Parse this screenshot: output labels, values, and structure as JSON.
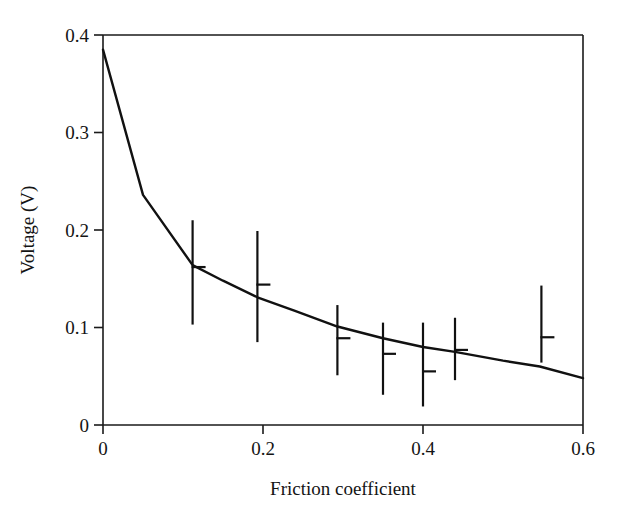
{
  "chart_data": {
    "type": "line",
    "title": "",
    "xlabel": "Friction coefficient",
    "ylabel": "Voltage (V)",
    "xlim": [
      0,
      0.6
    ],
    "ylim": [
      0,
      0.4
    ],
    "xticks": [
      0,
      0.2,
      0.4,
      0.6
    ],
    "xtick_labels": [
      "0",
      "0.2",
      "0.4",
      "0.6"
    ],
    "yticks": [
      0,
      0.1,
      0.2,
      0.3,
      0.4
    ],
    "ytick_labels": [
      "0",
      "0.1",
      "0.2",
      "0.3",
      "0.4"
    ],
    "grid": false,
    "legend": null,
    "line_color": "#111111",
    "series": [
      {
        "name": "model curve",
        "x": [
          0.0,
          0.05,
          0.112,
          0.15,
          0.193,
          0.24,
          0.293,
          0.35,
          0.4,
          0.44,
          0.5,
          0.546,
          0.6
        ],
        "y": [
          0.385,
          0.236,
          0.164,
          0.148,
          0.131,
          0.117,
          0.101,
          0.089,
          0.08,
          0.075,
          0.066,
          0.06,
          0.048
        ]
      }
    ],
    "error_bars": [
      {
        "x": 0.112,
        "y": 0.162,
        "low": 0.103,
        "high": 0.21
      },
      {
        "x": 0.193,
        "y": 0.144,
        "low": 0.085,
        "high": 0.199
      },
      {
        "x": 0.293,
        "y": 0.089,
        "low": 0.051,
        "high": 0.123
      },
      {
        "x": 0.35,
        "y": 0.073,
        "low": 0.031,
        "high": 0.105
      },
      {
        "x": 0.4,
        "y": 0.055,
        "low": 0.019,
        "high": 0.105
      },
      {
        "x": 0.44,
        "y": 0.077,
        "low": 0.046,
        "high": 0.11
      },
      {
        "x": 0.548,
        "y": 0.09,
        "low": 0.064,
        "high": 0.143
      }
    ]
  },
  "axes": {
    "x_axis_label": "Friction coefficient",
    "y_axis_label": "Voltage (V)"
  }
}
